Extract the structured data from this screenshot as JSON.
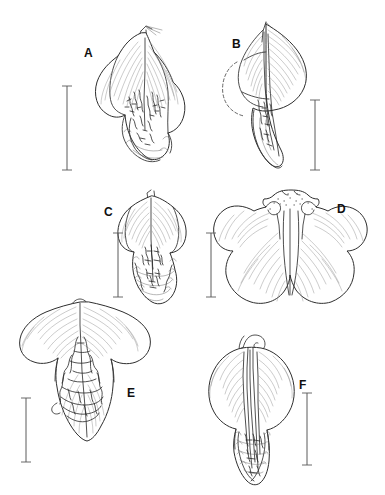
{
  "figure": {
    "kind": "botanical-line-illustration-plate",
    "background_color": "#ffffff",
    "ink_color": "#2e2e2e",
    "width": 385,
    "height": 495,
    "panel_count": 6
  },
  "panels": [
    {
      "label": "A",
      "label_x": 84,
      "label_y": 47,
      "subject": "orchid labellum, frontal spread view with fringed callus",
      "drawing_x": 92,
      "drawing_y": 24,
      "drawing_w": 108,
      "drawing_h": 160,
      "scalebar": {
        "x": 66,
        "y": 86,
        "length": 82,
        "orientation": "vertical",
        "caps": "both"
      }
    },
    {
      "label": "B",
      "label_x": 232,
      "label_y": 38,
      "subject": "orchid labellum, lateral view with dashed hidden outline",
      "drawing_x": 229,
      "drawing_y": 28,
      "drawing_w": 80,
      "drawing_h": 152,
      "scalebar": {
        "x": 314,
        "y": 100,
        "length": 68,
        "orientation": "vertical",
        "caps": "both"
      }
    },
    {
      "label": "C",
      "label_x": 104,
      "label_y": 206,
      "subject": "orchid labellum, frontal view with crisped apical margin",
      "drawing_x": 130,
      "drawing_y": 192,
      "drawing_w": 72,
      "drawing_h": 120,
      "scalebar": {
        "x": 117,
        "y": 232,
        "length": 62,
        "orientation": "vertical",
        "caps": "both"
      }
    },
    {
      "label": "D",
      "label_x": 337,
      "label_y": 203,
      "subject": "four-lobed orchid labellum with paired incurved horns",
      "drawing_x": 233,
      "drawing_y": 190,
      "drawing_w": 144,
      "drawing_h": 125,
      "scalebar": {
        "x": 210,
        "y": 232,
        "length": 62,
        "orientation": "vertical",
        "caps": "both"
      }
    },
    {
      "label": "E",
      "label_x": 127,
      "label_y": 392,
      "subject": "broad orchid labellum with elongate lobed callus",
      "drawing_x": 18,
      "drawing_y": 302,
      "drawing_w": 132,
      "drawing_h": 155,
      "scalebar": {
        "x": 25,
        "y": 398,
        "length": 62,
        "orientation": "vertical",
        "caps": "both"
      }
    },
    {
      "label": "F",
      "label_x": 299,
      "label_y": 379,
      "subject": "ovate orchid labellum with apical curled appendage",
      "drawing_x": 205,
      "drawing_y": 338,
      "drawing_w": 82,
      "drawing_h": 135,
      "scalebar": {
        "x": 304,
        "y": 393,
        "length": 70,
        "orientation": "vertical",
        "caps": "both"
      }
    }
  ]
}
